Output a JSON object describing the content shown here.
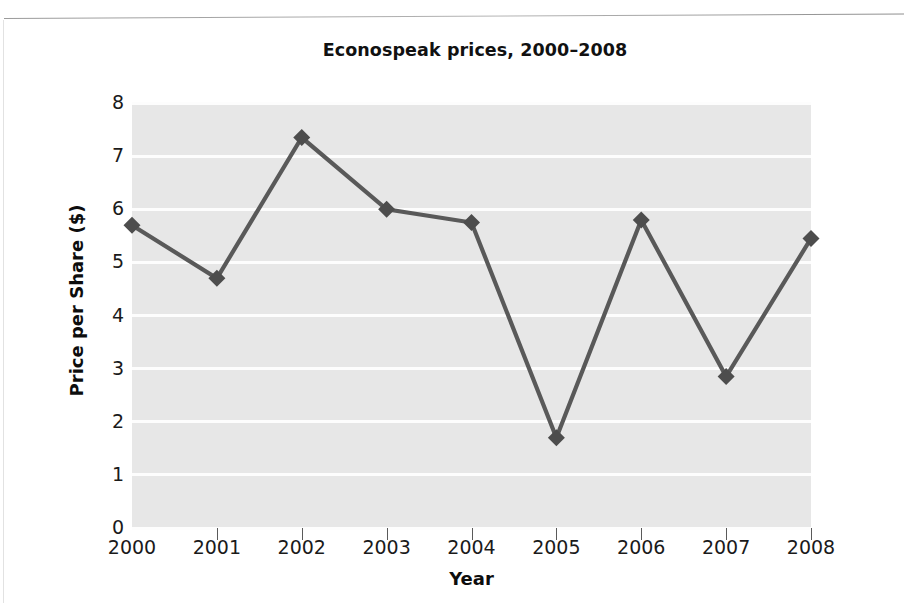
{
  "chart_data": {
    "type": "line",
    "title": "Econospeak prices, 2000–2008",
    "xlabel": "Year",
    "ylabel": "Price per Share ($)",
    "categories": [
      "2000",
      "2001",
      "2002",
      "2003",
      "2004",
      "2005",
      "2006",
      "2007",
      "2008"
    ],
    "values": [
      5.7,
      4.7,
      7.35,
      6.0,
      5.75,
      1.7,
      5.8,
      2.85,
      5.45
    ],
    "x": [
      2000,
      2001,
      2002,
      2003,
      2004,
      2005,
      2006,
      2007,
      2008
    ],
    "ylim": [
      0,
      8
    ],
    "yticks": [
      "8",
      "7",
      "6",
      "5",
      "4",
      "3",
      "2",
      "1",
      "0"
    ],
    "ytick_values": [
      8,
      7,
      6,
      5,
      4,
      3,
      2,
      1,
      0
    ],
    "xlim": [
      2000,
      2008
    ],
    "grid": "horizontal",
    "legend": "none",
    "marker": "diamond",
    "series_color": "#595959",
    "marker_color": "#4d4d4d",
    "plot_background": "#e7e7e7",
    "gridline_color": "#fdfdfd",
    "text_color": "#111111"
  }
}
